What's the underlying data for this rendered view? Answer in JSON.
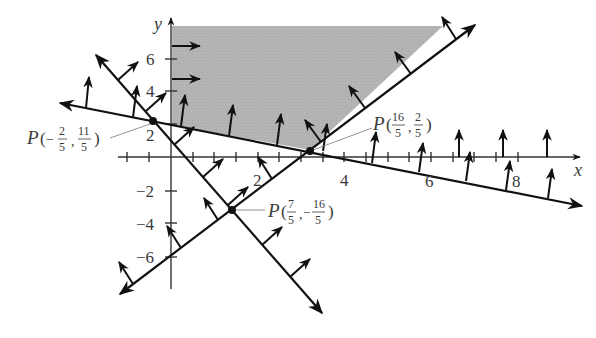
{
  "diagram": {
    "type": "feasible-region-with-constraint-normals",
    "colors": {
      "line": "#111111",
      "axis": "#333333",
      "shade": "#b4b4b4",
      "text": "#3a3a3a",
      "leader": "#777777"
    },
    "axes": {
      "x_label": "x",
      "y_label": "y",
      "x_ticks": [
        "2",
        "4",
        "6",
        "8"
      ],
      "y_ticks": [
        "6",
        "4",
        "2",
        "−2",
        "−4",
        "−6"
      ]
    },
    "points": [
      {
        "name": "P",
        "x_num": "2",
        "x_den": "5",
        "x_sign": "−",
        "y_num": "11",
        "y_den": "5",
        "y_sign": "",
        "value": "(-2/5, 11/5)"
      },
      {
        "name": "P",
        "x_num": "16",
        "x_den": "5",
        "x_sign": "",
        "y_num": "2",
        "y_den": "5",
        "y_sign": "",
        "value": "(16/5, 2/5)"
      },
      {
        "name": "P",
        "x_num": "7",
        "x_den": "5",
        "x_sign": "",
        "y_num": "16",
        "y_den": "5",
        "y_sign": "−",
        "value": "(7/5, -16/5)"
      }
    ],
    "labels": {
      "p_prefix": "P(",
      "comma": ",",
      "close": ")"
    },
    "lines": [
      {
        "name": "shallow-decreasing-line",
        "through": [
          "P(-2/5,11/5)",
          "P(16/5,2/5)"
        ]
      },
      {
        "name": "steep-decreasing-line",
        "through": [
          "P(-2/5,11/5)",
          "P(7/5,-16/5)"
        ]
      },
      {
        "name": "increasing-line",
        "through": [
          "P(7/5,-16/5)",
          "P(16/5,2/5)"
        ]
      }
    ]
  }
}
